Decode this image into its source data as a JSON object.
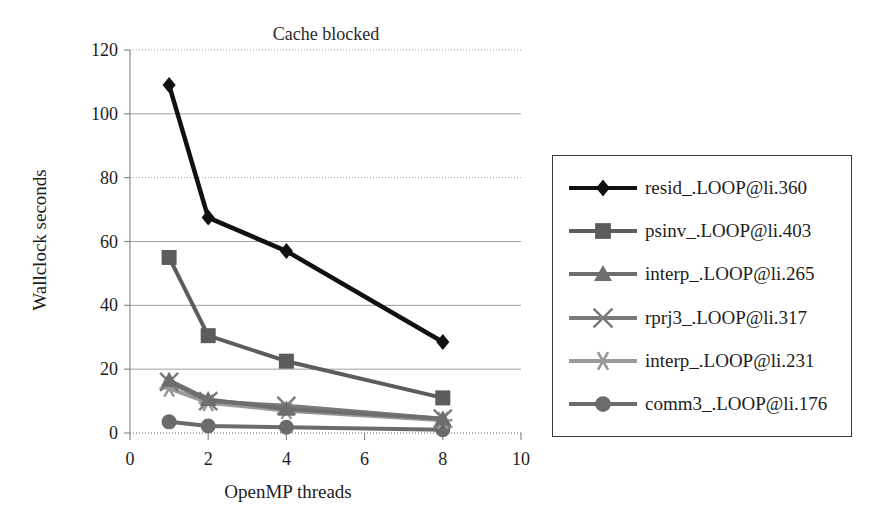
{
  "chart_data": {
    "type": "line",
    "title": "Cache blocked",
    "xlabel": "OpenMP threads",
    "ylabel": "Wallclock seconds",
    "xlim": [
      0,
      10
    ],
    "ylim": [
      0,
      120
    ],
    "xticks": [
      "0",
      "2",
      "4",
      "6",
      "8",
      "10"
    ],
    "xtick_values": [
      0,
      2,
      4,
      6,
      8,
      10
    ],
    "yticks": [
      "0",
      "20",
      "40",
      "60",
      "80",
      "100",
      "120"
    ],
    "ytick_values": [
      0,
      20,
      40,
      60,
      80,
      100,
      120
    ],
    "grid": true,
    "grid_axis": "y",
    "legend_position": "right-outside",
    "x": [
      1,
      2,
      4,
      8
    ],
    "series": [
      {
        "name": "resid_.LOOP@li.360",
        "marker": "diamond",
        "color": "#111111",
        "values": [
          109,
          67.5,
          57,
          28.5
        ]
      },
      {
        "name": "psinv_.LOOP@li.403",
        "marker": "square",
        "color": "#5c5c5c",
        "values": [
          55,
          30.5,
          22.5,
          11
        ]
      },
      {
        "name": "interp_.LOOP@li.265",
        "marker": "triangle",
        "color": "#6e6e6e",
        "values": [
          16.5,
          10.5,
          7.5,
          4.5
        ]
      },
      {
        "name": "rprj3_.LOOP@li.317",
        "marker": "x",
        "color": "#7a7a7a",
        "values": [
          16,
          10,
          8.5,
          4.5
        ]
      },
      {
        "name": "interp_.LOOP@li.231",
        "marker": "asterisk",
        "color": "#9a9a9a",
        "values": [
          14,
          9.5,
          7,
          4
        ]
      },
      {
        "name": "comm3_.LOOP@li.176",
        "marker": "circle",
        "color": "#6b6b6b",
        "values": [
          3.5,
          2.2,
          1.8,
          1
        ]
      }
    ]
  },
  "colors": {
    "grid": "#9e9e9e",
    "axis": "#8a8a8a",
    "legend_border": "#3a3a3a",
    "text": "#1d1d1d"
  }
}
